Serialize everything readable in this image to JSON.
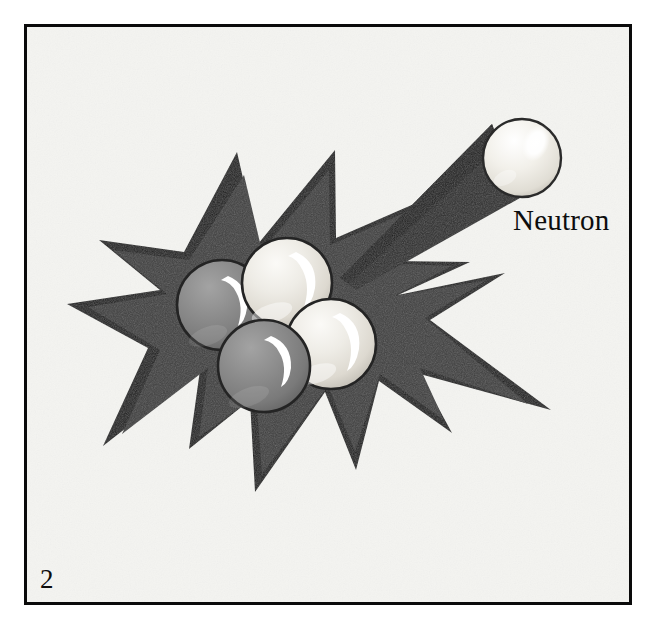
{
  "figure": {
    "number": "2",
    "caption_label": "Neutron",
    "kind": "nuclear-fission-illustration",
    "background_color": "#f4f4f1",
    "frame_color": "#000000",
    "texture": "paper-grain"
  },
  "labels": {
    "neutron": "Neutron",
    "page_number": "2"
  },
  "colors": {
    "page_background": "#ffffff",
    "panel_background": "#f4f4f1",
    "frame_border": "#0a0a0a",
    "burst_outline": "#1c1c1c",
    "burst_fill": "#3c3c3c",
    "trail_dark": "#2b2b2b",
    "proton_sphere": "#8b8b8b",
    "proton_sphere_dark": "#6f6f6f",
    "neutron_sphere": "#ebe9e3",
    "neutron_sphere_dark": "#c9c6bd",
    "sphere_outline": "#2a2a2a",
    "specular_highlight": "#ffffff",
    "text_color": "#0d0d0d"
  },
  "elements": {
    "frame": {
      "name": "illustration-frame",
      "x": 24,
      "y": 24,
      "width": 608,
      "height": 581,
      "stroke_width": 3
    },
    "burst": {
      "name": "explosion-starburst",
      "description": "jagged multi-point star burst representing the splitting nucleus",
      "point_count": 11
    },
    "motion_trail": {
      "name": "neutron-motion-trail",
      "description": "dark tapering wedge showing the incoming neutron path",
      "from": [
        560,
        155
      ],
      "to": [
        345,
        275
      ]
    },
    "incoming_neutron": {
      "name": "incoming-neutron-sphere",
      "cx": 522,
      "cy": 158,
      "r": 39,
      "type": "neutron"
    },
    "nucleons": [
      {
        "name": "nucleon-proton-left",
        "cx": 222,
        "cy": 305,
        "r": 45,
        "type": "proton",
        "label": "proton"
      },
      {
        "name": "nucleon-neutron-top",
        "cx": 287,
        "cy": 283,
        "r": 45,
        "type": "neutron",
        "label": "neutron"
      },
      {
        "name": "nucleon-neutron-right",
        "cx": 331,
        "cy": 344,
        "r": 45,
        "type": "neutron",
        "label": "neutron"
      },
      {
        "name": "nucleon-proton-bottom",
        "cx": 264,
        "cy": 366,
        "r": 46,
        "type": "proton",
        "label": "proton"
      }
    ],
    "neutron_label": {
      "name": "neutron-label",
      "x": 513,
      "y": 230,
      "font_size": 29
    },
    "figure_number": {
      "name": "figure-number",
      "x": 40,
      "y": 588,
      "font_size": 27
    }
  }
}
